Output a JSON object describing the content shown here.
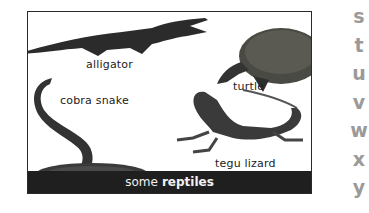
{
  "figure": {
    "animals": [
      {
        "name": "alligator",
        "label": "alligator"
      },
      {
        "name": "turtle",
        "label": "turtle"
      },
      {
        "name": "cobra-snake",
        "label": "cobra snake"
      },
      {
        "name": "tegu-lizard",
        "label": "tegu lizard"
      }
    ],
    "caption": {
      "prefix": "some",
      "emphasis": "reptiles"
    }
  },
  "alphabet_index": [
    "s",
    "t",
    "u",
    "v",
    "w",
    "x",
    "y"
  ],
  "colors": {
    "caption_bar": "#1f1f1f",
    "caption_text": "#f2f2f2",
    "index_letters": "#9a9a9a",
    "frame_border": "#2a2a2a"
  }
}
